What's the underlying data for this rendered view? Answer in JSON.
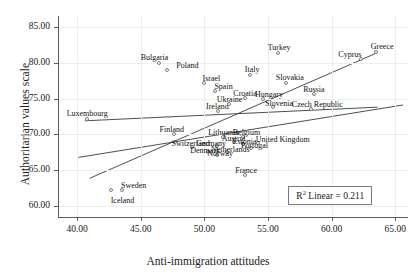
{
  "chart_data": {
    "type": "scatter",
    "title": "",
    "xlabel": "Anti-immigration attitudes",
    "ylabel": "Authoritarian values scale",
    "xlim": [
      38.5,
      66.0
    ],
    "ylim": [
      58.5,
      86.5
    ],
    "xticks": [
      "40.00",
      "45.00",
      "50.00",
      "55.00",
      "60.00",
      "65.00"
    ],
    "xtick_values": [
      40,
      45,
      50,
      55,
      60,
      65
    ],
    "yticks": [
      "60.00",
      "65.00",
      "70.00",
      "75.00",
      "80.00",
      "85.00"
    ],
    "ytick_values": [
      60,
      65,
      70,
      75,
      80,
      85
    ],
    "grid": true,
    "legend": "none",
    "annotation": "R2 Linear = 0.211",
    "annotation_prefix": "R",
    "annotation_sup": "2",
    "annotation_suffix": " Linear = 0.211",
    "points": [
      {
        "label": "Luxembourg",
        "x": 40.8,
        "y": 72.1,
        "lx": 0,
        "ly": -10
      },
      {
        "label": "Bulgaria",
        "x": 46.4,
        "y": 79.9,
        "lx": -4,
        "ly": -10
      },
      {
        "label": "Poland",
        "x": 47.1,
        "y": 79.0,
        "lx": 20,
        "ly": -9
      },
      {
        "label": "Sweden",
        "x": 43.5,
        "y": 62.3,
        "lx": 12,
        "ly": -9
      },
      {
        "label": "Iceland",
        "x": 42.7,
        "y": 62.3,
        "lx": 11,
        "ly": 6
      },
      {
        "label": "Finland",
        "x": 47.6,
        "y": 70.0,
        "lx": -2,
        "ly": -9
      },
      {
        "label": "Israel",
        "x": 50.0,
        "y": 77.1,
        "lx": 7,
        "ly": -9
      },
      {
        "label": "Spain",
        "x": 50.8,
        "y": 76.0,
        "lx": 9,
        "ly": -9
      },
      {
        "label": "Ireland",
        "x": 51.1,
        "y": 73.3,
        "lx": -1,
        "ly": -9
      },
      {
        "label": "Ukraine",
        "x": 51.9,
        "y": 74.2,
        "lx": 1,
        "ly": -9
      },
      {
        "label": "Croatia",
        "x": 53.2,
        "y": 75.1,
        "lx": 0,
        "ly": -9
      },
      {
        "label": "Italy",
        "x": 53.6,
        "y": 78.3,
        "lx": 2,
        "ly": -10
      },
      {
        "label": "Turkey",
        "x": 55.8,
        "y": 81.3,
        "lx": 1,
        "ly": -10
      },
      {
        "label": "Slovakia",
        "x": 56.4,
        "y": 77.2,
        "lx": 4,
        "ly": -10
      },
      {
        "label": "Hungary",
        "x": 54.6,
        "y": 75.0,
        "lx": 6,
        "ly": -9
      },
      {
        "label": "Slovenia",
        "x": 55.4,
        "y": 73.8,
        "lx": 6,
        "ly": -8
      },
      {
        "label": "Russia",
        "x": 58.6,
        "y": 75.6,
        "lx": 0,
        "ly": -9
      },
      {
        "label": "Czech Republic",
        "x": 58.4,
        "y": 73.6,
        "lx": 6,
        "ly": -9
      },
      {
        "label": "Cyprus",
        "x": 62.3,
        "y": 80.5,
        "lx": -11,
        "ly": -9
      },
      {
        "label": "Greece",
        "x": 63.5,
        "y": 81.5,
        "lx": 6,
        "ly": -10
      },
      {
        "label": "Lithuania",
        "x": 51.5,
        "y": 69.6,
        "lx": 0,
        "ly": -9
      },
      {
        "label": "Belgium",
        "x": 53.0,
        "y": 69.6,
        "lx": 4,
        "ly": -9
      },
      {
        "label": "Austria",
        "x": 52.3,
        "y": 68.9,
        "lx": 0,
        "ly": -8
      },
      {
        "label": "Estonia",
        "x": 53.0,
        "y": 68.7,
        "lx": 2,
        "ly": -7
      },
      {
        "label": "United Kingdom",
        "x": 54.2,
        "y": 68.8,
        "lx": 25,
        "ly": -8
      },
      {
        "label": "Germany",
        "x": 51.0,
        "y": 68.4,
        "lx": -6,
        "ly": -7
      },
      {
        "label": "Portugal",
        "x": 53.7,
        "y": 68.1,
        "lx": 3,
        "ly": -7
      },
      {
        "label": "Switzerland",
        "x": 49.0,
        "y": 68.2,
        "lx": -1,
        "ly": -8
      },
      {
        "label": "Netherlands",
        "x": 51.8,
        "y": 67.6,
        "lx": 3,
        "ly": -7
      },
      {
        "label": "Denmark",
        "x": 50.3,
        "y": 67.6,
        "lx": -3,
        "ly": -6
      },
      {
        "label": "Norway",
        "x": 51.0,
        "y": 67.1,
        "lx": 3,
        "ly": -6
      },
      {
        "label": "France",
        "x": 53.2,
        "y": 64.3,
        "lx": 1,
        "ly": -9
      }
    ],
    "fit_lines": [
      {
        "name": "upper-steep",
        "x1": 41.0,
        "y1": 63.9,
        "x2": 63.6,
        "y2": 81.4
      },
      {
        "name": "middle",
        "x1": 40.1,
        "y1": 66.8,
        "x2": 65.6,
        "y2": 74.1
      },
      {
        "name": "lower-flat",
        "x1": 40.6,
        "y1": 71.9,
        "x2": 63.6,
        "y2": 73.8
      }
    ]
  }
}
